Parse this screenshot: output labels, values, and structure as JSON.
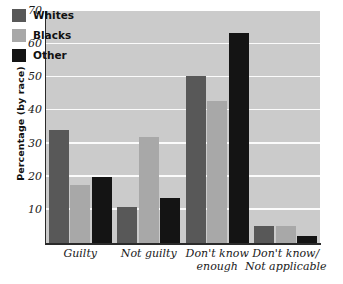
{
  "chart_data": {
    "type": "bar",
    "title": "",
    "subtitle": "",
    "xlabel": "",
    "ylabel": "Percentage (by race)",
    "ylim": [
      0,
      70
    ],
    "yticks": [
      10,
      20,
      30,
      40,
      50,
      60,
      70
    ],
    "grid": "horizontal",
    "legend_position": "top-left",
    "categories": [
      "Guilty",
      "Not guilty",
      "Don't know\nenough",
      "Don't know/\nNot applicable"
    ],
    "category_lines": [
      [
        "Guilty"
      ],
      [
        "Not guilty"
      ],
      [
        "Don't know",
        "enough"
      ],
      [
        "Don't know/",
        "Not applicable"
      ]
    ],
    "series": [
      {
        "name": "Whites",
        "color": "#585858",
        "values": [
          34,
          11,
          50.5,
          5
        ]
      },
      {
        "name": "Blacks",
        "color": "#a8a8a8",
        "values": [
          17.5,
          32,
          43,
          5
        ]
      },
      {
        "name": "Other",
        "color": "#141414",
        "values": [
          20,
          13.5,
          63.5,
          2
        ]
      }
    ]
  },
  "legend": {
    "items": [
      {
        "label": "Whites",
        "color": "#585858"
      },
      {
        "label": "Blacks",
        "color": "#a8a8a8"
      },
      {
        "label": "Other",
        "color": "#141414"
      }
    ]
  },
  "colors": {
    "plot_background": "#cbcbcb",
    "gridline": "#fbfbfb",
    "axis": "#2a2a2a",
    "page_background": "#ffffff"
  }
}
